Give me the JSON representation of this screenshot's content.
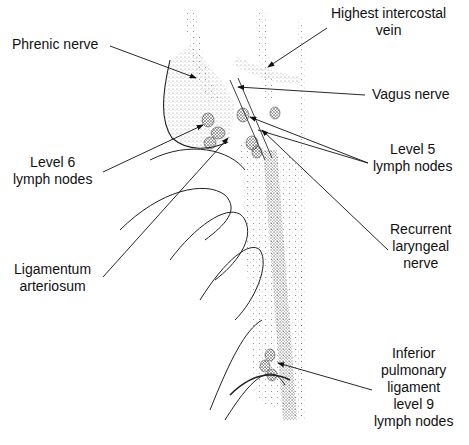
{
  "figure": {
    "type": "anatomical-illustration",
    "colors": {
      "ink": "#111111",
      "background": "#ffffff",
      "stipple": "#333333"
    }
  },
  "labels": {
    "phrenic_nerve": {
      "lines": [
        "Phrenic nerve"
      ]
    },
    "highest_intercostal_vein": {
      "lines": [
        "Highest intercostal",
        "vein"
      ]
    },
    "vagus_nerve": {
      "lines": [
        "Vagus nerve"
      ]
    },
    "level6": {
      "lines": [
        "Level 6",
        "lymph nodes"
      ]
    },
    "level5": {
      "lines": [
        "Level 5",
        "lymph nodes"
      ]
    },
    "recurrent_laryngeal": {
      "lines": [
        "Recurrent",
        "laryngeal",
        "nerve"
      ]
    },
    "ligamentum": {
      "lines": [
        "Ligamentum",
        "arteriosum"
      ]
    },
    "inferior_pulmonary": {
      "lines": [
        "Inferior",
        "pulmonary",
        "ligament",
        "level 9",
        "lymph nodes"
      ]
    }
  }
}
